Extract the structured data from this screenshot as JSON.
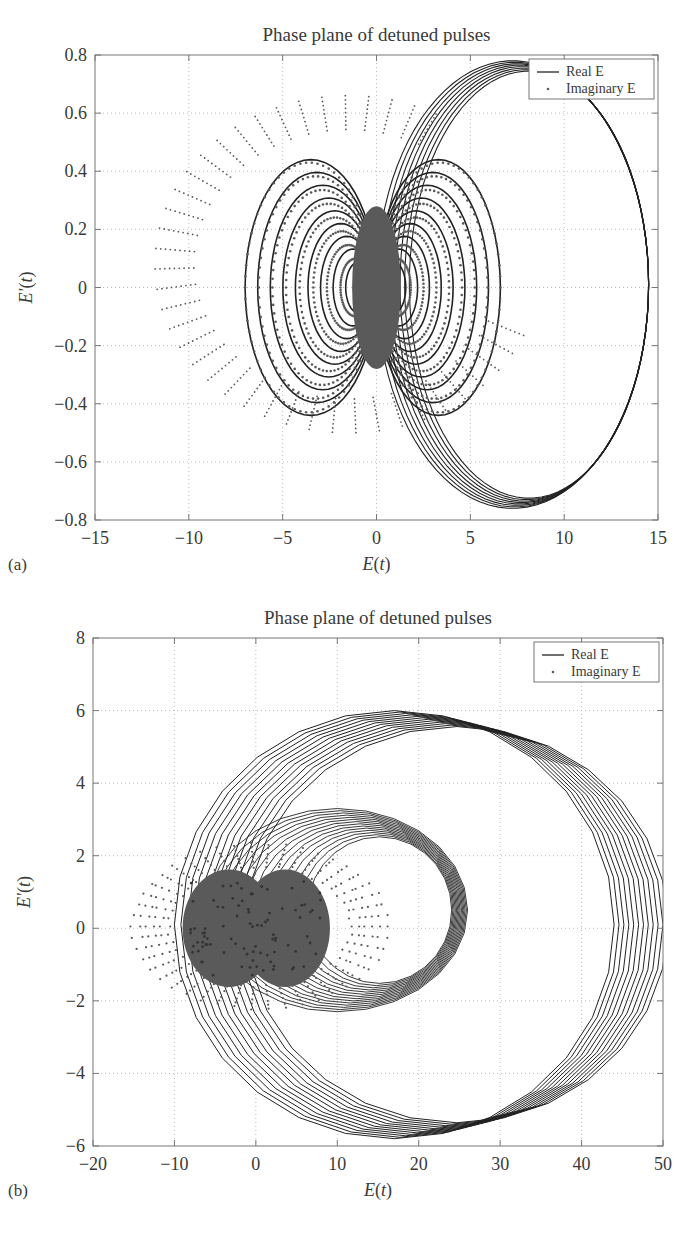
{
  "chart_data": [
    {
      "panel": "(a)",
      "type": "line",
      "title": "Phase plane of detuned pulses",
      "xlabel": "E(t)",
      "ylabel": "E'(t)",
      "xlim": [
        -15,
        15
      ],
      "ylim": [
        -0.8,
        0.8
      ],
      "xticks": [
        "-15",
        "-10",
        "-5",
        "0",
        "5",
        "10",
        "15"
      ],
      "yticks": [
        "0.8",
        "0.6",
        "0.4",
        "0.2",
        "0",
        "-0.2",
        "-0.4",
        "-0.6",
        "-0.8"
      ],
      "grid": true,
      "legend_position": "upper right",
      "legend": [
        "Real E",
        "Imaginary E"
      ],
      "series": [
        {
          "name": "Real E",
          "style": "solid line",
          "description": "Nested closed orbits forming two lobes around origin (approx. E in [-6.8, 6.5], E' in [-0.45, 0.45]) plus a large outer loop on the right spanning E ~ 0 to 14.5, E' from -0.75 to 0.78",
          "outer_loop": {
            "x_min": 0,
            "x_max": 14.5,
            "y_min": -0.75,
            "y_max": 0.78
          },
          "inner_lobes": {
            "x_min": -6.8,
            "x_max": 6.5,
            "y_min": -0.45,
            "y_max": 0.45
          }
        },
        {
          "name": "Imaginary E",
          "style": "dots",
          "description": "Dotted orbits overlapping the inner lobes, dense core near origin, with an outer dotted ring spanning E ~ -11.8 to 8.8, E' ~ -0.5 to 0.67",
          "outer_ring": {
            "x_min": -11.8,
            "x_max": 8.8,
            "y_min": -0.5,
            "y_max": 0.67
          },
          "core": {
            "x_min": -2,
            "x_max": 2,
            "y_min": -0.25,
            "y_max": 0.25
          }
        }
      ]
    },
    {
      "panel": "(b)",
      "type": "line",
      "title": "Phase plane of detuned pulses",
      "xlabel": "E(t)",
      "ylabel": "E'(t)",
      "xlim": [
        -20,
        50
      ],
      "ylim": [
        -6,
        8
      ],
      "xticks": [
        "-20",
        "-10",
        "0",
        "10",
        "20",
        "30",
        "40",
        "50"
      ],
      "yticks": [
        "8",
        "6",
        "4",
        "2",
        "0",
        "-2",
        "-4",
        "-6"
      ],
      "grid": true,
      "legend_position": "upper right",
      "legend": [
        "Real E",
        "Imaginary E"
      ],
      "series": [
        {
          "name": "Real E",
          "style": "solid line",
          "description": "Large nested loops: outer family spanning E ~ -10 to 46, E' ~ -5.9 to 6.0; middle family spanning E ~ -5 to 30, E' ~ -2.2 to 3.3",
          "outer_loops": {
            "x_min": -10,
            "x_max": 46,
            "y_min": -5.9,
            "y_max": 6.0
          },
          "middle_loops": {
            "x_min": -5,
            "x_max": 30,
            "y_min": -2.2,
            "y_max": 3.3
          }
        },
        {
          "name": "Imaginary E",
          "style": "dots",
          "description": "Dense two-lobed dotted blob centered near origin spanning E ~ -9 to 9, E' ~ -1.7 to 1.7, with radial dot spikes out to E ~ -14 and 16",
          "blob": {
            "x_min": -9,
            "x_max": 9,
            "y_min": -1.7,
            "y_max": 1.7
          },
          "spikes": {
            "x_min": -14,
            "x_max": 16,
            "y_min": -2.3,
            "y_max": 2.3
          }
        }
      ]
    }
  ],
  "panels": {
    "a": {
      "title": "Phase plane of detuned pulses",
      "label": "(a)",
      "xlabel": "E(t)",
      "ylabel": "E'(t)",
      "legend_real": "Real E",
      "legend_imag": "Imaginary E"
    },
    "b": {
      "title": "Phase plane of detuned pulses",
      "label": "(b)",
      "xlabel": "E(t)",
      "ylabel": "E'(t)",
      "legend_real": "Real E",
      "legend_imag": "Imaginary E"
    }
  },
  "colors": {
    "real_line": "#222222",
    "imag_dots": "#5a5a5a",
    "axes": "#777777",
    "grid": "#bdbdbd",
    "text": "#3a3a3a"
  }
}
